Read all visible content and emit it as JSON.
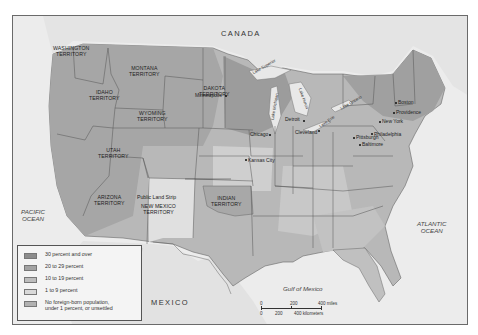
{
  "map": {
    "countries": {
      "canada": "CANADA",
      "mexico": "MEXICO"
    },
    "oceans": {
      "pacific": [
        "PACIFIC",
        "OCEAN"
      ],
      "atlantic": [
        "ATLANTIC",
        "OCEAN"
      ],
      "gulf": "Gulf of Mexico"
    },
    "territories": [
      {
        "id": "washington",
        "lines": [
          "WASHINGTON",
          "TERRITORY"
        ]
      },
      {
        "id": "montana",
        "lines": [
          "MONTANA",
          "TERRITORY"
        ]
      },
      {
        "id": "idaho",
        "lines": [
          "IDAHO",
          "TERRITORY"
        ]
      },
      {
        "id": "dakota",
        "lines": [
          "DAKOTA",
          "TERRITORY"
        ]
      },
      {
        "id": "wyoming",
        "lines": [
          "WYOMING",
          "TERRITORY"
        ]
      },
      {
        "id": "utah",
        "lines": [
          "UTAH",
          "TERRITORY"
        ]
      },
      {
        "id": "arizona",
        "lines": [
          "ARIZONA",
          "TERRITORY"
        ]
      },
      {
        "id": "new-mexico",
        "lines": [
          "NEW MEXICO",
          "TERRITORY"
        ]
      },
      {
        "id": "indian",
        "lines": [
          "INDIAN",
          "TERRITORY"
        ]
      }
    ],
    "special_regions": {
      "public_land_strip": "Public Land Strip"
    },
    "lakes": [
      "Lake Superior",
      "Lake Michigan",
      "Lake Huron",
      "Lake Erie",
      "Lake Ontario"
    ],
    "cities": [
      "Minneapolis",
      "Chicago",
      "Detroit",
      "Cleveland",
      "Kansas City",
      "Pittsburgh",
      "Philadelphia",
      "Baltimore",
      "New York",
      "Boston",
      "Providence"
    ]
  },
  "legend": {
    "items": [
      {
        "label": "30 percent and over",
        "color": "#8c8c8c"
      },
      {
        "label": "20 to 29 percent",
        "color": "#a3a3a3"
      },
      {
        "label": "10 to 19 percent",
        "color": "#bdbdbd"
      },
      {
        "label": "1 to 9 percent",
        "color": "#d9d9d9"
      },
      {
        "label": "No foreign-born population,",
        "label2": "under 1 percent, or unsettled",
        "color": "#b1b1b1"
      }
    ]
  },
  "scale_bar": {
    "miles": [
      "0",
      "200",
      "400 miles"
    ],
    "kilometers": [
      "0",
      "200",
      "400 kilometers"
    ]
  },
  "colors": {
    "water": "#ececec",
    "land_light": "#d8d8d8",
    "land_mid": "#bdbdbd",
    "land_dark": "#a0a0a0",
    "land_darkest": "#8c8c8c",
    "border": "#555555"
  }
}
